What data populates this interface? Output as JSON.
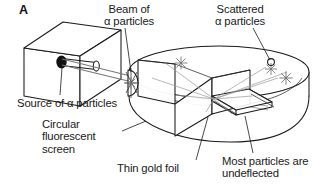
{
  "figure": {
    "panel_letter": "A",
    "background_color": "#ffffff",
    "line_color": "#1a1a1a",
    "ray_color": "#8a8a8a",
    "source_dot_color": "#111111",
    "width": 332,
    "height": 196
  },
  "labels": {
    "beam": {
      "line1": "Beam of",
      "line2": "α particles"
    },
    "scattered": {
      "line1": "Scattered",
      "line2": "α particles"
    },
    "source": {
      "line1": "Source of α particles"
    },
    "screen": {
      "line1": "Circular",
      "line2": "fluorescent",
      "line3": "screen"
    },
    "foil": {
      "line1": "Thin gold foil"
    },
    "undeflected": {
      "line1": "Most particles are",
      "line2": "undeflected"
    }
  },
  "parts": {
    "source_box": "lead-source-box",
    "collimator": "collimator-tube",
    "source_dot": "alpha-source",
    "screen": "circular-fluorescent-screen",
    "foil": "thin-gold-foil",
    "beam": "alpha-beam",
    "scatter_marks": 4
  }
}
